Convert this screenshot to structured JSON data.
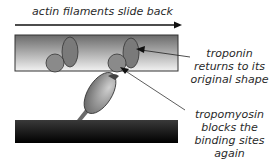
{
  "title_arrow": {
    "label": "actin filaments slide back"
  },
  "labels": {
    "troponin": [
      "troponin",
      "returns to its",
      "original shape"
    ],
    "tropomyosin": [
      "tropomyosin",
      "blocks the",
      "binding sites",
      "again"
    ]
  },
  "colors": {
    "actin_top": "#6a6a6a",
    "actin_bottom": "#f2f2f2",
    "myosin_filament": "#111111",
    "troponin": "#7a7a7a",
    "tropomyosin": "#8a8a8a",
    "text": "#2a2a2a"
  }
}
